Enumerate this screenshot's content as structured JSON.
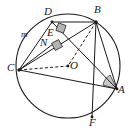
{
  "figure": {
    "type": "euclidean-geometry-diagram",
    "canvas": {
      "width": 131,
      "height": 131
    },
    "colors": {
      "stroke": "#1a1a1a",
      "background": "#ffffff",
      "angle_fill": "#c9c9c9",
      "right_angle_fill": "#b4b4b4",
      "dashed_stroke": "#1a1a1a"
    },
    "circle": {
      "name": "main-circle",
      "center_label": "O",
      "cx": 68,
      "cy": 66,
      "r": 52
    },
    "points": [
      {
        "id": "D",
        "label": "D",
        "x": 52,
        "y": 22,
        "label_x": 44,
        "label_y": 8
      },
      {
        "id": "B",
        "label": "B",
        "x": 96,
        "y": 22,
        "label_x": 96,
        "label_y": 6
      },
      {
        "id": "m",
        "label": "m",
        "x": 30,
        "y": 36,
        "label_x": 22,
        "label_y": 30
      },
      {
        "id": "E",
        "label": "E",
        "x": 58,
        "y": 35,
        "label_x": 48,
        "label_y": 30
      },
      {
        "id": "N",
        "label": "N",
        "x": 54,
        "y": 45,
        "label_x": 42,
        "label_y": 40
      },
      {
        "id": "C",
        "label": "C",
        "x": 19,
        "y": 70,
        "label_x": 8,
        "label_y": 63
      },
      {
        "id": "O",
        "label": "O",
        "x": 68,
        "y": 66,
        "label_x": 70,
        "label_y": 62
      },
      {
        "id": "A",
        "label": "A",
        "x": 117,
        "y": 89,
        "label_x": 119,
        "label_y": 86
      },
      {
        "id": "F",
        "label": "F",
        "x": 92,
        "y": 117,
        "label_x": 90,
        "label_y": 119
      }
    ],
    "segments": [
      {
        "name": "segment-D-A",
        "from": "D",
        "to": "A",
        "style": "solid"
      },
      {
        "name": "segment-D-B",
        "from": "D",
        "to": "B",
        "style": "solid"
      },
      {
        "name": "segment-B-C",
        "from": "B",
        "to": "C",
        "style": "solid"
      },
      {
        "name": "segment-B-F",
        "from": "B",
        "to": "F",
        "style": "solid"
      },
      {
        "name": "segment-B-A",
        "from": "B",
        "to": "A",
        "style": "solid"
      },
      {
        "name": "segment-C-A",
        "from": "C",
        "to": "A",
        "style": "solid"
      },
      {
        "name": "segment-C-D",
        "from": "C",
        "to": "D",
        "style": "solid"
      },
      {
        "name": "segment-C-N",
        "from": "C",
        "to": "N",
        "style": "solid"
      },
      {
        "name": "segment-C-O-dashed",
        "from": "C",
        "to": "O",
        "style": "dashed"
      },
      {
        "name": "segment-B-O-dashed",
        "from": "B",
        "to": "O",
        "style": "dashed"
      }
    ],
    "markers": [
      {
        "name": "right-angle-at-E",
        "at": "E",
        "type": "right-angle-square"
      },
      {
        "name": "right-angle-at-N",
        "at": "N",
        "type": "right-angle-square"
      },
      {
        "name": "shaded-angle-at-A",
        "at": "A",
        "type": "shaded-sector"
      }
    ]
  }
}
